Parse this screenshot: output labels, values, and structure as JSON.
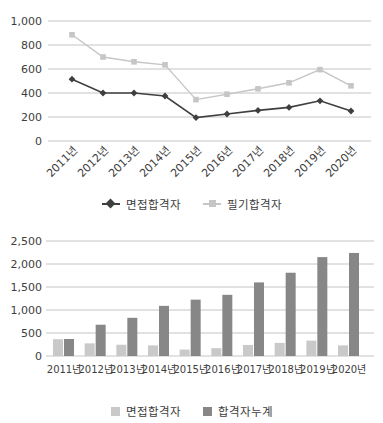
{
  "colors": {
    "background": "#ffffff",
    "gridline": "#c4c4c4",
    "tick_text": "#3d3d3d"
  },
  "chart_data": [
    {
      "id": "passers-by-year-line",
      "type": "line",
      "categories": [
        "2011년",
        "2012년",
        "2013년",
        "2014년",
        "2015년",
        "2016년",
        "2017년",
        "2018년",
        "2019년",
        "2020년"
      ],
      "series": [
        {
          "name": "면접합격자",
          "marker": "diamond",
          "color": "#3f3f3f",
          "values": [
            515,
            400,
            400,
            375,
            195,
            225,
            255,
            280,
            335,
            250
          ]
        },
        {
          "name": "필기합격자",
          "marker": "square",
          "color": "#c6c6c6",
          "values": [
            885,
            700,
            660,
            635,
            345,
            390,
            435,
            485,
            595,
            460
          ]
        }
      ],
      "title": "",
      "xlabel": "",
      "ylabel": "",
      "ylim": [
        0,
        1000
      ],
      "ytick_step": 200,
      "ytick_labels": [
        "0",
        "200",
        "400",
        "600",
        "800",
        "1,000"
      ],
      "grid": true,
      "legend_position": "bottom",
      "x_label_rotation": -45
    },
    {
      "id": "cumulative-passers-bar",
      "type": "bar",
      "categories": [
        "2011년",
        "2012년",
        "2013년",
        "2014년",
        "2015년",
        "2016년",
        "2017년",
        "2018년",
        "2019년",
        "2020년"
      ],
      "series": [
        {
          "name": "면접합격자",
          "color": "#c9c9c9",
          "values": [
            365,
            275,
            245,
            230,
            140,
            170,
            240,
            285,
            335,
            230
          ]
        },
        {
          "name": "합격자누계",
          "color": "#878787",
          "values": [
            370,
            680,
            830,
            1090,
            1225,
            1330,
            1600,
            1810,
            2150,
            2240
          ]
        }
      ],
      "title": "",
      "xlabel": "",
      "ylabel": "",
      "ylim": [
        0,
        2500
      ],
      "ytick_step": 500,
      "ytick_labels": [
        "0",
        "500",
        "1,000",
        "1,500",
        "2,000",
        "2,500"
      ],
      "grid": true,
      "legend_position": "bottom",
      "x_label_rotation": 0
    }
  ]
}
